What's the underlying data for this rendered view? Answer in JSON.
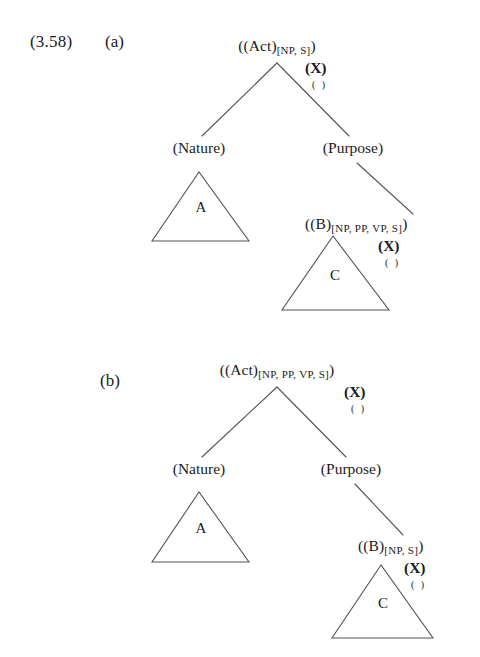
{
  "figure": {
    "example_number": "(3.58)",
    "ink_color": "#1a1a1a",
    "background_color": "#ffffff",
    "line_color": "#555555"
  },
  "trees": [
    {
      "id": "a",
      "label": "(a)",
      "root": {
        "main": "((Act)",
        "subscript": "[NP, S]",
        "close": ")",
        "variable": "(X)",
        "empty": "( )"
      },
      "left_child": "(Nature)",
      "right_child": "(Purpose)",
      "left_triangle_letter": "A",
      "right_node": {
        "main": "((B)",
        "subscript": "[NP, PP, VP, S]",
        "close": ")",
        "variable": "(X)",
        "empty": "( )"
      },
      "right_triangle_letter": "C"
    },
    {
      "id": "b",
      "label": "(b)",
      "root": {
        "main": "((Act)",
        "subscript": "[NP, PP, VP, S]",
        "close": ")",
        "variable": "(X)",
        "empty": "( )"
      },
      "left_child": "(Nature)",
      "right_child": "(Purpose)",
      "left_triangle_letter": "A",
      "right_node": {
        "main": "((B)",
        "subscript": "[NP, S]",
        "close": ")",
        "variable": "(X)",
        "empty": "( )"
      },
      "right_triangle_letter": "C"
    }
  ]
}
